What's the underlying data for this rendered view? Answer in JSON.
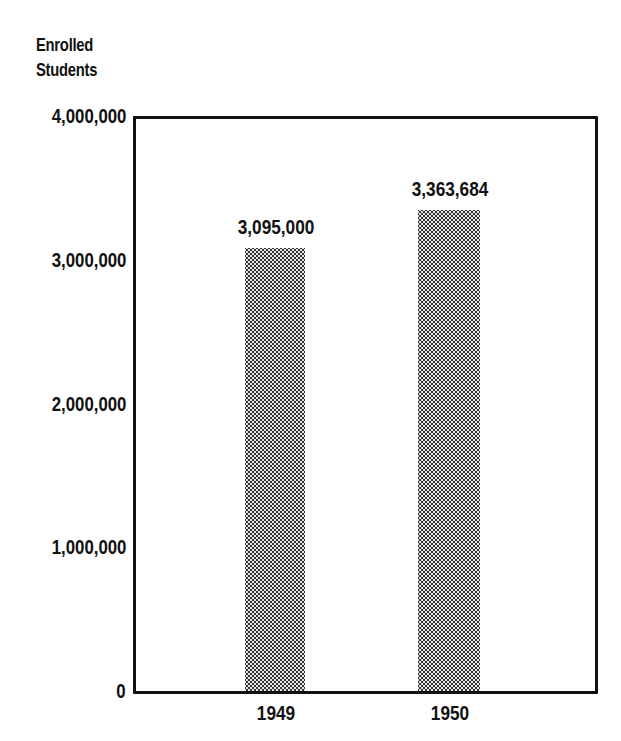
{
  "chart_data": {
    "type": "bar",
    "title": "",
    "ylabel": "Enrolled Students",
    "ylabel_lines": [
      "Enrolled",
      "Students"
    ],
    "xlabel": "",
    "categories": [
      "1949",
      "1950"
    ],
    "values": [
      3095000,
      3363684
    ],
    "data_labels": [
      "3,095,000",
      "3,363,684"
    ],
    "ylim": [
      0,
      4000000
    ],
    "yticks": [
      0,
      1000000,
      2000000,
      3000000,
      4000000
    ],
    "ytick_labels": [
      "0",
      "1,000,000",
      "2,000,000",
      "3,000,000",
      "4,000,000"
    ],
    "grid": false,
    "legend": null,
    "bar_fill": "stippled gray"
  }
}
